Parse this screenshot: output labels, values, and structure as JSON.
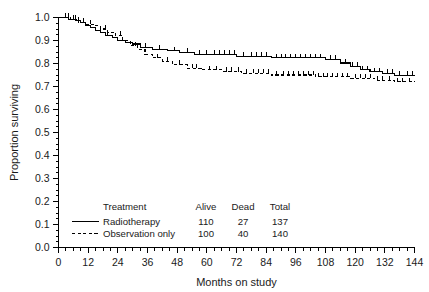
{
  "chart_data": {
    "type": "line",
    "subtype": "kaplan-meier-step",
    "title": "",
    "xlabel": "Months on study",
    "ylabel": "Proportion surviving",
    "xlim": [
      0,
      144
    ],
    "ylim": [
      0.0,
      1.0
    ],
    "xticks": [
      0,
      12,
      24,
      36,
      48,
      60,
      72,
      84,
      96,
      108,
      120,
      132,
      144
    ],
    "xtick_labels": [
      "0",
      "12",
      "24",
      "36",
      "48",
      "60",
      "72",
      "84",
      "96",
      "108",
      "120",
      "132",
      "144"
    ],
    "yticks": [
      0.0,
      0.1,
      0.2,
      0.3,
      0.4,
      0.5,
      0.6,
      0.7,
      0.8,
      0.9,
      1.0
    ],
    "ytick_labels": [
      "0.0",
      "0.1",
      "0.2",
      "0.3",
      "0.4",
      "0.5",
      "0.6",
      "0.7",
      "0.8",
      "0.9",
      "1.0"
    ],
    "x_minor_tick_interval": 3,
    "y_minor_tick_interval": 0.025,
    "grid": false,
    "legend_position": "inside-bottom-left",
    "series": [
      {
        "name": "Radiotherapy",
        "style": "solid",
        "color": "#000000",
        "steps": [
          [
            0,
            1.0
          ],
          [
            4,
            1.0
          ],
          [
            4,
            0.993
          ],
          [
            7,
            0.993
          ],
          [
            7,
            0.986
          ],
          [
            9,
            0.986
          ],
          [
            9,
            0.979
          ],
          [
            11,
            0.979
          ],
          [
            11,
            0.964
          ],
          [
            13,
            0.964
          ],
          [
            13,
            0.957
          ],
          [
            15,
            0.957
          ],
          [
            15,
            0.943
          ],
          [
            17,
            0.943
          ],
          [
            17,
            0.936
          ],
          [
            19,
            0.936
          ],
          [
            19,
            0.921
          ],
          [
            22,
            0.921
          ],
          [
            22,
            0.914
          ],
          [
            24,
            0.914
          ],
          [
            24,
            0.899
          ],
          [
            27,
            0.899
          ],
          [
            27,
            0.892
          ],
          [
            30,
            0.892
          ],
          [
            30,
            0.885
          ],
          [
            33,
            0.885
          ],
          [
            33,
            0.87
          ],
          [
            38,
            0.87
          ],
          [
            38,
            0.862
          ],
          [
            44,
            0.862
          ],
          [
            44,
            0.855
          ],
          [
            49,
            0.855
          ],
          [
            49,
            0.847
          ],
          [
            55,
            0.847
          ],
          [
            55,
            0.84
          ],
          [
            72,
            0.84
          ],
          [
            72,
            0.832
          ],
          [
            86,
            0.832
          ],
          [
            86,
            0.825
          ],
          [
            108,
            0.825
          ],
          [
            108,
            0.817
          ],
          [
            114,
            0.817
          ],
          [
            114,
            0.802
          ],
          [
            118,
            0.802
          ],
          [
            118,
            0.787
          ],
          [
            122,
            0.787
          ],
          [
            122,
            0.772
          ],
          [
            126,
            0.772
          ],
          [
            126,
            0.764
          ],
          [
            131,
            0.764
          ],
          [
            131,
            0.757
          ],
          [
            136,
            0.757
          ],
          [
            136,
            0.749
          ],
          [
            144,
            0.749
          ]
        ],
        "censor_months": [
          3,
          6,
          8,
          10,
          20,
          26,
          35,
          41,
          47,
          52,
          57,
          60,
          63,
          65,
          67,
          69,
          71,
          75,
          78,
          80,
          82,
          84,
          88,
          90,
          92,
          94,
          96,
          98,
          100,
          102,
          104,
          106,
          110,
          112,
          116,
          119,
          121,
          123,
          125,
          128,
          130,
          133,
          135,
          138,
          141,
          143
        ]
      },
      {
        "name": "Observation only",
        "style": "dashed",
        "color": "#000000",
        "steps": [
          [
            0,
            1.0
          ],
          [
            5,
            1.0
          ],
          [
            5,
            0.993
          ],
          [
            8,
            0.993
          ],
          [
            8,
            0.979
          ],
          [
            11,
            0.979
          ],
          [
            11,
            0.971
          ],
          [
            14,
            0.971
          ],
          [
            14,
            0.964
          ],
          [
            17,
            0.964
          ],
          [
            17,
            0.95
          ],
          [
            20,
            0.95
          ],
          [
            20,
            0.936
          ],
          [
            23,
            0.936
          ],
          [
            23,
            0.921
          ],
          [
            26,
            0.921
          ],
          [
            26,
            0.899
          ],
          [
            29,
            0.899
          ],
          [
            29,
            0.877
          ],
          [
            32,
            0.877
          ],
          [
            32,
            0.862
          ],
          [
            35,
            0.862
          ],
          [
            35,
            0.84
          ],
          [
            38,
            0.84
          ],
          [
            38,
            0.825
          ],
          [
            42,
            0.825
          ],
          [
            42,
            0.81
          ],
          [
            46,
            0.81
          ],
          [
            46,
            0.795
          ],
          [
            52,
            0.795
          ],
          [
            52,
            0.78
          ],
          [
            58,
            0.78
          ],
          [
            58,
            0.772
          ],
          [
            66,
            0.772
          ],
          [
            66,
            0.765
          ],
          [
            74,
            0.765
          ],
          [
            74,
            0.757
          ],
          [
            86,
            0.757
          ],
          [
            86,
            0.75
          ],
          [
            104,
            0.75
          ],
          [
            104,
            0.742
          ],
          [
            118,
            0.742
          ],
          [
            118,
            0.735
          ],
          [
            128,
            0.735
          ],
          [
            128,
            0.727
          ],
          [
            136,
            0.727
          ],
          [
            136,
            0.72
          ],
          [
            144,
            0.72
          ]
        ],
        "censor_months": [
          4,
          7,
          13,
          19,
          25,
          31,
          40,
          44,
          49,
          54,
          56,
          61,
          64,
          68,
          70,
          73,
          76,
          79,
          81,
          83,
          85,
          88,
          91,
          93,
          95,
          97,
          99,
          101,
          103,
          105,
          107,
          109,
          111,
          113,
          115,
          117,
          120,
          122,
          124,
          126,
          129,
          131,
          134,
          137,
          139,
          142
        ]
      }
    ]
  },
  "legend": {
    "headers": [
      "Treatment",
      "Alive",
      "Dead",
      "Total"
    ],
    "rows": [
      {
        "treatment": "Radiotherapy",
        "alive": "110",
        "dead": "27",
        "total": "137",
        "style": "solid"
      },
      {
        "treatment": "Observation only",
        "alive": "100",
        "dead": "40",
        "total": "140",
        "style": "dashed"
      }
    ]
  }
}
